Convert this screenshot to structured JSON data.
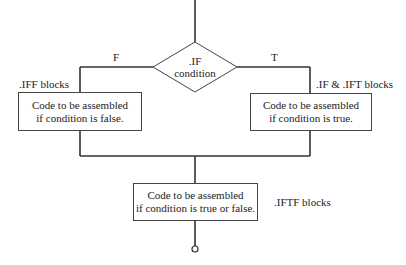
{
  "diagram": {
    "decision": {
      "line1": ".IF",
      "line2": "condition"
    },
    "branch_false_label": "F",
    "branch_true_label": "T",
    "false_block": {
      "tag": ".IFF blocks",
      "line1": "Code to be assembled",
      "line2": "if condition is false."
    },
    "true_block": {
      "tag": ".IF & .IFT blocks",
      "line1": "Code to be assembled",
      "line2": "if condition is true."
    },
    "both_block": {
      "tag": ".IFTF blocks",
      "line1": "Code to be assembled",
      "line2": "if condition is true or false."
    },
    "colors": {
      "line": "#333333",
      "background": "#ffffff",
      "text": "#222222"
    }
  }
}
